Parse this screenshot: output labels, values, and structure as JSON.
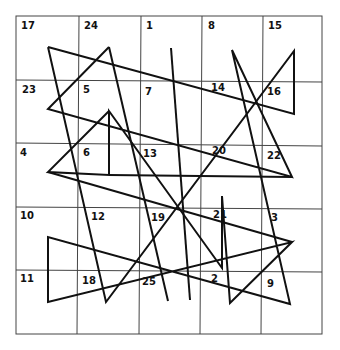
{
  "grid": {
    "rows": 5,
    "cols": 5,
    "numbers": [
      [
        "17",
        "24",
        "1",
        "8",
        "15"
      ],
      [
        "23",
        "5",
        "7",
        "14",
        "16"
      ],
      [
        "4",
        "6",
        "13",
        "20",
        "22"
      ],
      [
        "10",
        "12",
        "19",
        "21",
        "3"
      ],
      [
        "11",
        "18",
        "25",
        "2",
        "9"
      ]
    ]
  },
  "colors": {
    "line": "#111111",
    "grid": "#444444",
    "background": "#ffffff"
  }
}
